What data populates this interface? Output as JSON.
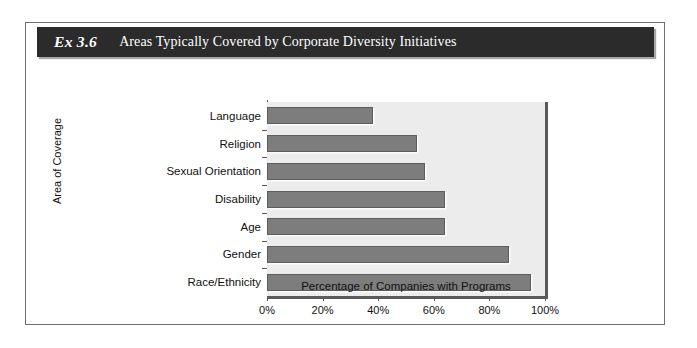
{
  "header": {
    "exhibit_number": "Ex 3.6",
    "title": "Areas Typically Covered by Corporate Diversity Initiatives",
    "bar_color": "#2b2b2b",
    "text_color": "#ffffff"
  },
  "chart_data": {
    "type": "bar",
    "orientation": "horizontal",
    "title": "Areas Typically Covered by Corporate Diversity Initiatives",
    "categories": [
      "Language",
      "Religion",
      "Sexual Orientation",
      "Disability",
      "Age",
      "Gender",
      "Race/Ethnicity"
    ],
    "values": [
      38,
      54,
      57,
      64,
      64,
      87,
      95
    ],
    "xlabel": "Percentage of Companies with Programs",
    "ylabel": "Area of Coverage",
    "xlim": [
      0,
      100
    ],
    "xticks": [
      0,
      20,
      40,
      60,
      80,
      100
    ],
    "xticklabels": [
      "0%",
      "20%",
      "40%",
      "60%",
      "80%",
      "100%"
    ],
    "grid": false,
    "legend": false,
    "bar_color": "#7d7d7d",
    "bar_edge_color": "#5d5d5d",
    "plot_background": "#ececec",
    "axis_color": "#5a5a5a"
  }
}
